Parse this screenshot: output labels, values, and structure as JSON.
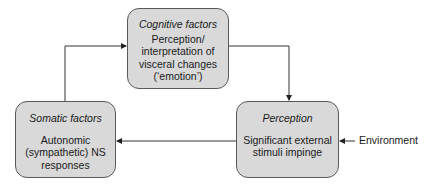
{
  "diagram": {
    "nodes": [
      {
        "id": "cognitive",
        "title": "Cognitive factors",
        "body": "Perception/ interpretation of visceral changes (‘emotion’)"
      },
      {
        "id": "somatic",
        "title": "Somatic factors",
        "body": "Autonomic (sympathetic) NS responses"
      },
      {
        "id": "perception",
        "title": "Perception",
        "body": "Significant external stimuli impinge"
      }
    ],
    "external_input": {
      "label": "Environment"
    },
    "edges": [
      {
        "from": "cognitive",
        "to": "perception"
      },
      {
        "from": "perception",
        "to": "somatic"
      },
      {
        "from": "somatic",
        "to": "cognitive"
      },
      {
        "from": "environment",
        "to": "perception"
      }
    ],
    "colors": {
      "box_fill": "#d9d9d9",
      "box_border": "#5a5a5a",
      "line": "#333333"
    }
  }
}
